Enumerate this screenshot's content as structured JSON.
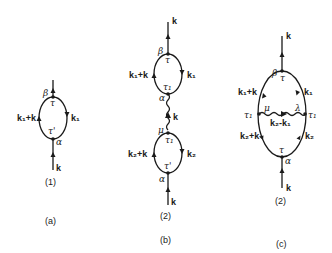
{
  "figures": [
    {
      "id": "a",
      "caption": "(a)",
      "diagram_number": "(1)",
      "labels": {
        "top_momentum": "k",
        "bottom_momentum": "k",
        "left_line": "k₁+k",
        "right_line": "k₁",
        "top_vertex_greek": "β",
        "top_vertex_time": "τ",
        "bottom_vertex_greek": "α",
        "bottom_vertex_time": "τ'"
      }
    },
    {
      "id": "b",
      "caption": "(b)",
      "diagram_number": "(2)",
      "labels": {
        "top_momentum": "k",
        "upper_left_line": "k₁+k",
        "upper_right_line": "k₁",
        "upper_top_greek": "β",
        "upper_top_time": "τ",
        "upper_bottom_greek": "α",
        "upper_bottom_time": "τ₁",
        "wavy_momentum": "k",
        "lower_top_greek": "μ",
        "lower_top_time": "τ₁",
        "lower_left_line": "k₂+k",
        "lower_right_line": "k₂",
        "lower_bottom_greek": "α",
        "lower_bottom_time": "τ'",
        "bottom_momentum": "k"
      }
    },
    {
      "id": "c",
      "caption": "(c)",
      "diagram_number": "(2)",
      "labels": {
        "top_momentum": "k",
        "top_greek": "β",
        "top_time": "τ",
        "upper_left_line": "k₁+k",
        "upper_right_line": "k₁",
        "left_time": "τ₁",
        "right_time": "τ₁",
        "left_greek": "μ",
        "right_greek": "λ",
        "wavy_momentum": "k₂-k₁",
        "lower_left_line": "k₂+k",
        "lower_right_line": "k₂",
        "bottom_time": "τ",
        "bottom_greek": "α",
        "bottom_momentum": "k"
      }
    }
  ]
}
